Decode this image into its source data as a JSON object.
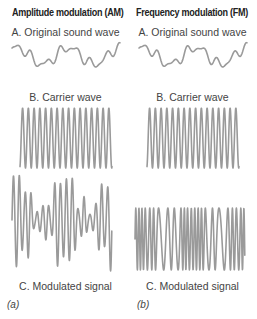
{
  "colors": {
    "wave": "#9a9a9a",
    "title": "#222222",
    "text": "#444444",
    "background": "#ffffff"
  },
  "am": {
    "title": "Amplitude modulation (AM)",
    "sound_label": "A. Original sound wave",
    "carrier_label": "B. Carrier wave",
    "modulated_label": "C. Modulated signal",
    "panel_label": "(a)"
  },
  "fm": {
    "title": "Frequency modulation (FM)",
    "sound_label": "A. Original sound wave",
    "carrier_label": "B. Carrier wave",
    "modulated_label": "C. Modulated signal",
    "panel_label": "(b)"
  }
}
